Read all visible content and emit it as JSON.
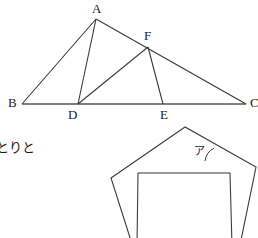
{
  "figure": {
    "stroke_dark": "#3a3a3a",
    "stroke_gray": "#808080",
    "background": "#ffffff",
    "triangle": {
      "vertex_labels": [
        {
          "name": "A",
          "text": "A",
          "x": 92,
          "y": 2
        },
        {
          "name": "B",
          "text": "B",
          "x": 8,
          "y": 96
        },
        {
          "name": "C",
          "text": "C",
          "x": 250,
          "y": 96
        },
        {
          "name": "D",
          "text": "D",
          "x": 68,
          "y": 108
        },
        {
          "name": "E",
          "text": "E",
          "x": 160,
          "y": 108
        },
        {
          "name": "F",
          "text": "F",
          "x": 144,
          "y": 29
        }
      ],
      "points": {
        "A": {
          "x": 96,
          "y": 19
        },
        "B": {
          "x": 22,
          "y": 104
        },
        "C": {
          "x": 246,
          "y": 104
        },
        "D": {
          "x": 78,
          "y": 104
        },
        "E": {
          "x": 163,
          "y": 104
        },
        "F": {
          "x": 148,
          "y": 47
        }
      },
      "segments": [
        {
          "name": "segment-BC",
          "from": "B",
          "to": "C"
        },
        {
          "name": "segment-BA",
          "from": "B",
          "to": "A"
        },
        {
          "name": "segment-AC",
          "from": "A",
          "to": "C"
        },
        {
          "name": "segment-AD",
          "from": "A",
          "to": "D"
        },
        {
          "name": "segment-DF",
          "from": "D",
          "to": "F"
        },
        {
          "name": "segment-FE",
          "from": "F",
          "to": "E"
        }
      ]
    },
    "pentagon": {
      "name": "pentagon-shape",
      "points": "185,127 111,178 133,247 240,245 256,167"
    },
    "square": {
      "name": "square-shape",
      "points": "138,173 230,173 232,246 137,247"
    },
    "angle_marker": {
      "name": "angle-arc-a",
      "label": "ア",
      "label_x": 194,
      "label_y": 146,
      "arc_path": "M 214 148 A 17 17 0 0 0 205 161"
    }
  },
  "annotations": {
    "japanese_note": "とりと",
    "note_x": 0,
    "note_y": 141
  }
}
